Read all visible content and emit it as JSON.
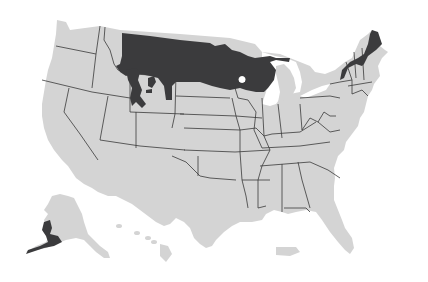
{
  "map": {
    "title": "",
    "description": "United States map with shaded distribution range",
    "colors": {
      "land": "#d4d4d4",
      "range": "#3b3b3d",
      "border": "#3a3a3a",
      "background": "#ffffff"
    },
    "shaded_regions": [
      "northern-plains-montana-to-minnesota",
      "wyoming-islands",
      "northern-maine",
      "new-hampshire-vermont-north",
      "southwest-alaska"
    ]
  }
}
